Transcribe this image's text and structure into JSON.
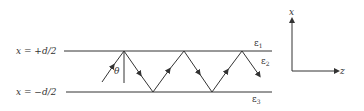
{
  "diagram": {
    "type": "slab waveguide ray diagram",
    "boundaries": [
      {
        "label": "x = +d/2",
        "y": 51
      },
      {
        "label": "x = −d/2",
        "y": 92
      }
    ],
    "media": [
      {
        "symbol": "ε",
        "sub": "1"
      },
      {
        "symbol": "ε",
        "sub": "2"
      },
      {
        "symbol": "ε",
        "sub": "3"
      }
    ],
    "angle_label": "θ",
    "axes": {
      "vertical": "x",
      "horizontal": "z"
    },
    "ray_points": [
      [
        102,
        82
      ],
      [
        124,
        51
      ],
      [
        153,
        92
      ],
      [
        184,
        51
      ],
      [
        212,
        92
      ],
      [
        242,
        51
      ],
      [
        261,
        77
      ]
    ],
    "colors": {
      "stroke": "#333333",
      "background": "#ffffff"
    }
  }
}
